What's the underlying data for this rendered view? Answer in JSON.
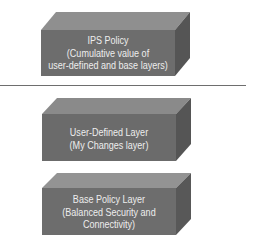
{
  "diagram": {
    "colors": {
      "front_face": "#6d6d6d",
      "top_face": "#8f8f8f",
      "side_face": "#555555",
      "text": "#eeeeee",
      "rule": "#6e6e6e"
    },
    "boxes": [
      {
        "id": "ips-policy",
        "line1": "IPS Policy",
        "line2": "(Cumulative value of",
        "line3": "user-defined and base layers)"
      },
      {
        "id": "user-defined-layer",
        "line1": "User-Defined Layer",
        "line2": "(My Changes layer)",
        "line3": ""
      },
      {
        "id": "base-policy-layer",
        "line1": "Base Policy Layer",
        "line2": "(Balanced Security and",
        "line3": "Connectivity)"
      }
    ]
  }
}
